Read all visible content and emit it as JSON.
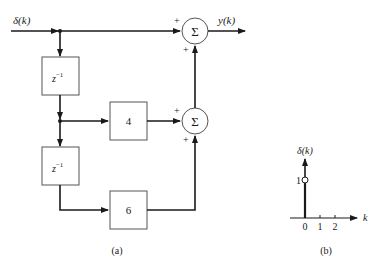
{
  "figure_a": {
    "caption": "(a)",
    "input_label": "δ(k)",
    "output_label": "y(k)",
    "delay_blocks": [
      {
        "label_base": "z",
        "label_sup": "−1"
      },
      {
        "label_base": "z",
        "label_sup": "−1"
      }
    ],
    "gain_blocks": [
      {
        "label": "4"
      },
      {
        "label": "6"
      }
    ],
    "summers": [
      {
        "symbol": "Σ",
        "signs": [
          "+",
          "+"
        ]
      },
      {
        "symbol": "Σ",
        "signs": [
          "+",
          "+"
        ]
      }
    ]
  },
  "figure_b": {
    "caption": "(b)",
    "y_label": "δ(k)",
    "x_label": "k",
    "y_tick": "1",
    "x_ticks": [
      "0",
      "1",
      "2"
    ]
  },
  "colors": {
    "line": "#1a1a1a",
    "background": "#ffffff"
  }
}
